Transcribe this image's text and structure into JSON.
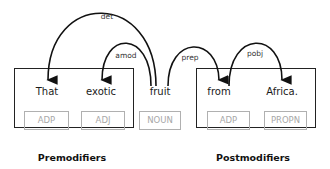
{
  "tokens": [
    {
      "text": "That",
      "pos": "ADP"
    },
    {
      "text": "exotic",
      "pos": "ADJ"
    },
    {
      "text": "fruit",
      "pos": "NOUN"
    },
    {
      "text": "from",
      "pos": "ADP"
    },
    {
      "text": "Africa.",
      "pos": "PROPN"
    }
  ],
  "arcs": [
    {
      "label": "det",
      "head": "fruit",
      "dependent": "That"
    },
    {
      "label": "amod",
      "head": "fruit",
      "dependent": "exotic"
    },
    {
      "label": "prep",
      "head": "fruit",
      "dependent": "from"
    },
    {
      "label": "pobj",
      "head": "from",
      "dependent": "Africa."
    }
  ],
  "groups": {
    "premodifiers": "Premodifiers",
    "postmodifiers": "Postmodifiers"
  }
}
